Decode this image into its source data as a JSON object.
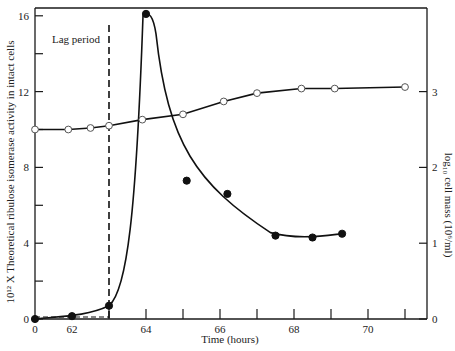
{
  "chart_data": {
    "type": "line",
    "title": "",
    "xlabel": "Time (hours)",
    "ylabel": "10¹² X Theoretical ribulose isomerase activity in intact cells",
    "y2label": "log₁₀ cell mass (10⁶/ml)",
    "x_ticklabels": [
      "0",
      "62",
      "64",
      "66",
      "68",
      "70"
    ],
    "x_tick_values": [
      61,
      62,
      63,
      64,
      65,
      66,
      67,
      68,
      69,
      70,
      71
    ],
    "x_axis_break_label": "0",
    "xlim": [
      61,
      71.8
    ],
    "ylim": [
      0,
      16.5
    ],
    "y_ticklabels": [
      "0",
      "4",
      "8",
      "12",
      "16"
    ],
    "y_tick_values": [
      0,
      2,
      4,
      6,
      8,
      10,
      12,
      14,
      16
    ],
    "y2lim": [
      0,
      3.5
    ],
    "y2_ticklabels": [
      "0",
      "1",
      "2",
      "3"
    ],
    "y2_tick_values": [
      0,
      1,
      2,
      3
    ],
    "annotation": {
      "text": "Lag period",
      "x": 63
    },
    "series": [
      {
        "name": "Ribulose isomerase activity",
        "axis": "left",
        "marker": "filled-circle",
        "x": [
          61,
          62,
          63,
          64,
          65.1,
          66.2,
          67.5,
          68.5,
          69.3
        ],
        "y": [
          0,
          0.15,
          0.7,
          16.1,
          7.3,
          6.6,
          4.4,
          4.3,
          4.5
        ]
      },
      {
        "name": "Cell mass",
        "axis": "right",
        "marker": "open-circle",
        "x": [
          61,
          61.9,
          62.5,
          63,
          63.9,
          65,
          66.1,
          67,
          68.2,
          69.1,
          71
        ],
        "y": [
          2.5,
          2.5,
          2.52,
          2.55,
          2.63,
          2.7,
          2.87,
          2.98,
          3.04,
          3.04,
          3.06
        ]
      }
    ]
  }
}
